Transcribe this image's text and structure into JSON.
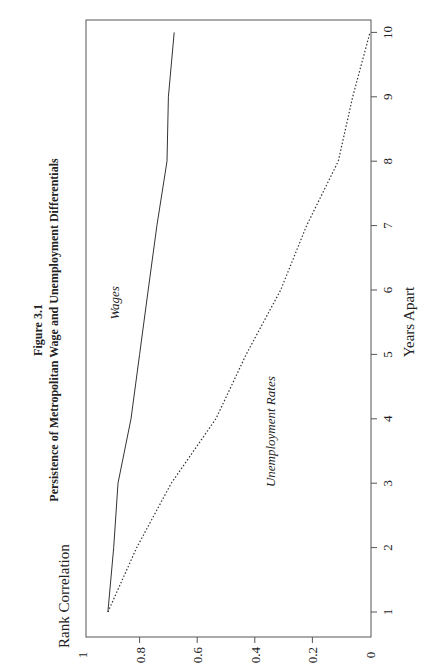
{
  "figure": {
    "number_label": "Figure 3.1",
    "title": "Persistence of Metropolitan Wage and Unemployment Differentials"
  },
  "chart_data": {
    "type": "line",
    "title": "Figure 3.1 Persistence of Metropolitan Wage and Unemployment Differentials",
    "xlabel": "Years Apart",
    "ylabel": "Rank Correlation",
    "x": [
      1,
      2,
      3,
      4,
      5,
      6,
      7,
      8,
      9,
      10
    ],
    "xticks": [
      "1",
      "2",
      "3",
      "4",
      "5",
      "6",
      "7",
      "8",
      "9",
      "10"
    ],
    "yticks": [
      "0",
      "0.2",
      "0.4",
      "0.6",
      "0.8",
      "1"
    ],
    "xlim": [
      1,
      10
    ],
    "ylim": [
      0,
      1
    ],
    "grid": false,
    "legend": "inline labels",
    "orientation": "rotated 90 degrees counter-clockwise",
    "series": [
      {
        "name": "Wages",
        "style": "solid",
        "values": [
          0.91,
          0.89,
          0.875,
          0.83,
          0.8,
          0.77,
          0.74,
          0.705,
          0.7,
          0.68
        ]
      },
      {
        "name": "Unemployment Rates",
        "style": "dotted",
        "values": [
          0.91,
          0.81,
          0.69,
          0.535,
          0.43,
          0.31,
          0.22,
          0.11,
          0.06,
          0.0
        ]
      }
    ],
    "annotations": [
      {
        "text": "Wages",
        "x": 5.8,
        "y": 0.87
      },
      {
        "text": "Unemployment Rates",
        "x": 3.8,
        "y": 0.33
      }
    ]
  }
}
